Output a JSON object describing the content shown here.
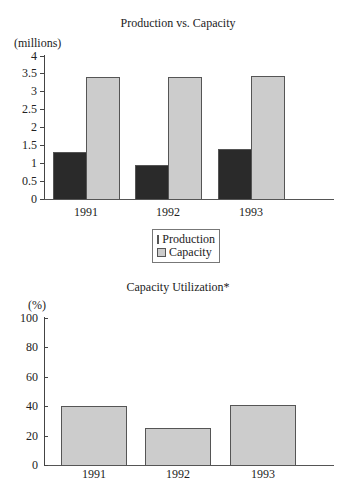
{
  "colors": {
    "production": "#2a2a2a",
    "capacity": "#cccccc",
    "axis": "#444444"
  },
  "chart_data": [
    {
      "type": "bar",
      "title": "Production vs. Capacity",
      "ylabel": "(millions)",
      "xlabel": "",
      "categories": [
        "1991",
        "1992",
        "1993"
      ],
      "series": [
        {
          "name": "Production",
          "values": [
            1.3,
            0.95,
            1.4
          ]
        },
        {
          "name": "Capacity",
          "values": [
            3.4,
            3.4,
            3.42
          ]
        }
      ],
      "ylim": [
        0,
        4
      ],
      "yticks": [
        "0",
        "0.5",
        "1",
        "1.5",
        "2",
        "2.5",
        "3",
        "3.5",
        "4"
      ],
      "grid": false,
      "legend": {
        "position": "below",
        "entries": [
          "Production",
          "Capacity"
        ]
      }
    },
    {
      "type": "bar",
      "title": "Capacity Utilization*",
      "ylabel": "(%)",
      "xlabel": "",
      "categories": [
        "1991",
        "1992",
        "1993"
      ],
      "values": [
        40,
        25,
        41
      ],
      "ylim": [
        0,
        100
      ],
      "yticks": [
        "0",
        "20",
        "40",
        "60",
        "80",
        "100"
      ],
      "grid": false
    }
  ]
}
